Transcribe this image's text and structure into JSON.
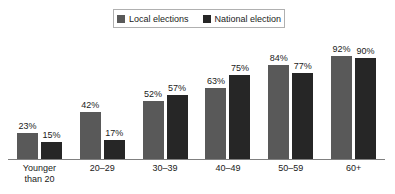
{
  "chart_data": {
    "type": "bar",
    "title": "",
    "subtitle": "",
    "xlabel": "",
    "ylabel": "",
    "ylim": [
      0,
      100
    ],
    "grid": false,
    "legend_position": "top-center",
    "value_suffix": "%",
    "categories": [
      "Younger than 20",
      "20–29",
      "30–39",
      "40–49",
      "50–59",
      "60+"
    ],
    "category_lines": [
      [
        "Younger",
        "than 20"
      ],
      [
        "20–29"
      ],
      [
        "30–39"
      ],
      [
        "40–49"
      ],
      [
        "50–59"
      ],
      [
        "60+"
      ]
    ],
    "series": [
      {
        "name": "Local elections",
        "color": "#595959",
        "values": [
          23,
          42,
          52,
          63,
          84,
          92
        ],
        "labels": [
          "23%",
          "42%",
          "52%",
          "63%",
          "84%",
          "92%"
        ]
      },
      {
        "name": "National election",
        "color": "#262626",
        "values": [
          15,
          17,
          57,
          75,
          77,
          90
        ],
        "labels": [
          "15%",
          "17%",
          "57%",
          "75%",
          "77%",
          "90%"
        ]
      }
    ]
  },
  "legend": {
    "entries": [
      {
        "label": "Local elections",
        "color": "#595959"
      },
      {
        "label": "National election",
        "color": "#262626"
      }
    ]
  },
  "colors": {
    "local": "#595959",
    "national": "#262626",
    "axis": "#808080",
    "legend_border": "#b0b0b0",
    "text": "#1a1a1a",
    "background": "#ffffff"
  }
}
